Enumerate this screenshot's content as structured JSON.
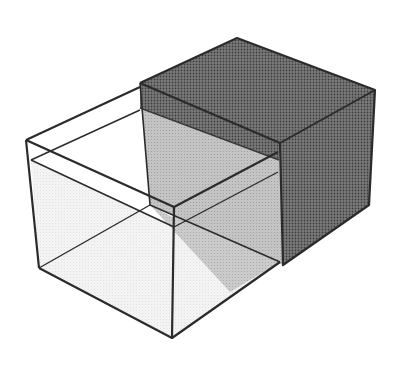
{
  "figure": {
    "description": "Two intersecting rectangular boxes: a transparent open box overlapping a solid dark-shaded box",
    "colors": {
      "background": "#ffffff",
      "outline": "#2b2b2b",
      "dark_box_top": "#6e6e6e",
      "dark_box_side": "#5a5a5a",
      "dark_box_front": "#666666",
      "overlap_region": "#bdbdbd",
      "clear_box_fill": "#f1f1f1",
      "water_fill": "#e6e6e6"
    },
    "clear_box": {
      "label": "transparent box",
      "top_left": [
        26,
        140
      ],
      "top_back": [
        140,
        87
      ],
      "top_front": [
        174,
        207
      ],
      "top_right": [
        278,
        152
      ],
      "bottom_left": [
        39,
        268
      ],
      "bottom_front": [
        172,
        338
      ],
      "bottom_right": [
        280,
        262
      ],
      "water_left": [
        31,
        160
      ],
      "water_back": [
        140,
        110
      ]
    },
    "dark_box": {
      "label": "shaded box",
      "top_back": [
        237,
        38
      ],
      "top_left": [
        140,
        83
      ],
      "top_right": [
        375,
        90
      ],
      "top_front": [
        280,
        143
      ],
      "bottom_front": [
        283,
        265
      ],
      "bottom_right": [
        369,
        205
      ]
    }
  }
}
